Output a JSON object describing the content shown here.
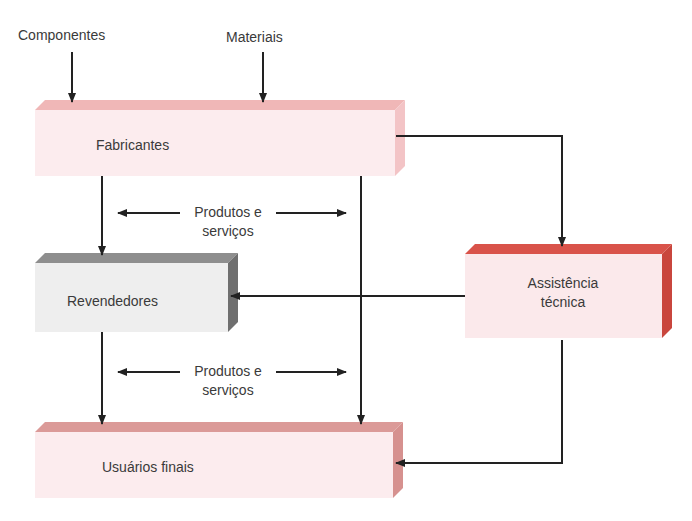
{
  "inputs": {
    "components": "Componentes",
    "materials": "Materiais"
  },
  "nodes": {
    "manufacturers": {
      "label": "Fabricantes",
      "face": "#fcecee",
      "top": "#f0b7b7",
      "side": "#f3c4c6"
    },
    "resellers": {
      "label": "Revendedores",
      "face": "#eeeeee",
      "top": "#8e8e8e",
      "side": "#6f6f6f"
    },
    "tech_support": {
      "label_line1": "Assistência",
      "label_line2": "técnica",
      "face": "#fbe9eb",
      "top": "#d9534a",
      "side": "#c9463d"
    },
    "end_users": {
      "label": "Usuários finais",
      "face": "#fcecee",
      "top": "#db9a98",
      "side": "#d6918f"
    }
  },
  "flows": {
    "upper": {
      "line1": "Produtos e",
      "line2": "serviços"
    },
    "lower": {
      "line1": "Produtos e",
      "line2": "serviços"
    }
  },
  "colors": {
    "arrow": "#222222"
  }
}
